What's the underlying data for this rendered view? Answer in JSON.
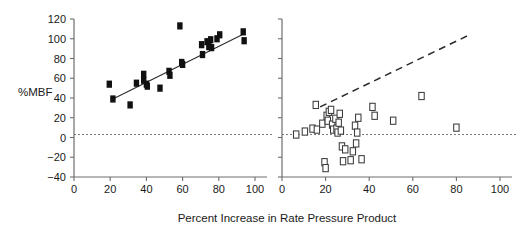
{
  "figure": {
    "width": 527,
    "height": 230,
    "background": "#ffffff",
    "shared_xlabel": "Percent Increase in Rate Pressure Product",
    "ylabel": "%MBF"
  },
  "chart_data": [
    {
      "type": "scatter",
      "panel": "left",
      "title": "",
      "xlabel": "Percent Increase in Rate Pressure Product",
      "ylabel": "%MBF",
      "xlim": [
        0,
        100
      ],
      "ylim": [
        -40,
        120
      ],
      "xticks": [
        0,
        20,
        40,
        60,
        80,
        100
      ],
      "yticks": [
        -40,
        -20,
        0,
        20,
        40,
        60,
        80,
        100,
        120
      ],
      "xtick_labels": [
        "0",
        "20",
        "40",
        "60",
        "80",
        "100"
      ],
      "ytick_labels": [
        "-40",
        "-20",
        "0",
        "20",
        "40",
        "60",
        "80",
        "100",
        "120"
      ],
      "grid": false,
      "legend": null,
      "marker_style": "filled-square",
      "marker_color": "#111111",
      "points": [
        {
          "x": 19.5,
          "y": 54
        },
        {
          "x": 21.5,
          "y": 39
        },
        {
          "x": 31.0,
          "y": 33
        },
        {
          "x": 34.5,
          "y": 55
        },
        {
          "x": 38.5,
          "y": 64
        },
        {
          "x": 38.5,
          "y": 58
        },
        {
          "x": 40.0,
          "y": 54
        },
        {
          "x": 40.5,
          "y": 52
        },
        {
          "x": 47.5,
          "y": 50
        },
        {
          "x": 52.5,
          "y": 67
        },
        {
          "x": 53.0,
          "y": 63
        },
        {
          "x": 58.5,
          "y": 113
        },
        {
          "x": 59.5,
          "y": 76
        },
        {
          "x": 60.0,
          "y": 74
        },
        {
          "x": 70.5,
          "y": 94
        },
        {
          "x": 71.0,
          "y": 84
        },
        {
          "x": 73.5,
          "y": 97
        },
        {
          "x": 74.5,
          "y": 92
        },
        {
          "x": 75.5,
          "y": 99
        },
        {
          "x": 76.0,
          "y": 91
        },
        {
          "x": 79.0,
          "y": 100
        },
        {
          "x": 80.5,
          "y": 104
        },
        {
          "x": 93.5,
          "y": 107
        },
        {
          "x": 94.0,
          "y": 98
        }
      ],
      "fit_line": {
        "style": "solid",
        "color": "#2b2b2b",
        "x_start": 21.5,
        "y_start": 39,
        "x_end": 94.0,
        "y_end": 105
      },
      "reference_line": {
        "style": "dotted",
        "y": 3,
        "color": "#777777"
      }
    },
    {
      "type": "scatter",
      "panel": "right",
      "title": "",
      "xlabel": "Percent Increase in Rate Pressure Product",
      "ylabel": "%MBF",
      "xlim": [
        0,
        100
      ],
      "ylim": [
        -40,
        120
      ],
      "xticks": [
        0,
        20,
        40,
        60,
        80,
        100
      ],
      "yticks": [
        -40,
        -20,
        0,
        20,
        40,
        60,
        80,
        100,
        120
      ],
      "xtick_labels": [
        "0",
        "20",
        "40",
        "60",
        "80",
        "100"
      ],
      "ytick_labels": [],
      "grid": false,
      "legend": null,
      "marker_style": "open-square",
      "marker_color": "#ffffff",
      "marker_edge_color": "#3b3b3b",
      "points": [
        {
          "x": 6.5,
          "y": 3
        },
        {
          "x": 10.5,
          "y": 6
        },
        {
          "x": 14.0,
          "y": 9
        },
        {
          "x": 15.5,
          "y": 33
        },
        {
          "x": 16.0,
          "y": 8
        },
        {
          "x": 18.5,
          "y": 14
        },
        {
          "x": 19.5,
          "y": -25
        },
        {
          "x": 20.0,
          "y": -31
        },
        {
          "x": 20.5,
          "y": 22
        },
        {
          "x": 21.0,
          "y": 17
        },
        {
          "x": 21.5,
          "y": 26
        },
        {
          "x": 22.5,
          "y": 28
        },
        {
          "x": 23.0,
          "y": 13
        },
        {
          "x": 23.5,
          "y": 8
        },
        {
          "x": 24.5,
          "y": 19
        },
        {
          "x": 25.0,
          "y": 9
        },
        {
          "x": 25.5,
          "y": 5
        },
        {
          "x": 26.0,
          "y": 15
        },
        {
          "x": 26.5,
          "y": 24
        },
        {
          "x": 27.0,
          "y": 7
        },
        {
          "x": 27.5,
          "y": -9
        },
        {
          "x": 28.0,
          "y": -24
        },
        {
          "x": 29.0,
          "y": -12
        },
        {
          "x": 31.5,
          "y": -23
        },
        {
          "x": 32.5,
          "y": -14
        },
        {
          "x": 33.5,
          "y": 12
        },
        {
          "x": 34.0,
          "y": -6
        },
        {
          "x": 34.5,
          "y": 5
        },
        {
          "x": 35.0,
          "y": 20
        },
        {
          "x": 36.5,
          "y": -22
        },
        {
          "x": 41.5,
          "y": 31
        },
        {
          "x": 42.5,
          "y": 22
        },
        {
          "x": 51.0,
          "y": 17
        },
        {
          "x": 64.0,
          "y": 42
        },
        {
          "x": 80.0,
          "y": 10
        }
      ],
      "fit_line": {
        "style": "dashed",
        "color": "#2b2b2b",
        "x_start": 17.5,
        "y_start": 31,
        "x_end": 86.0,
        "y_end": 104
      },
      "reference_line": {
        "style": "dotted",
        "y": 3,
        "color": "#777777"
      }
    }
  ]
}
